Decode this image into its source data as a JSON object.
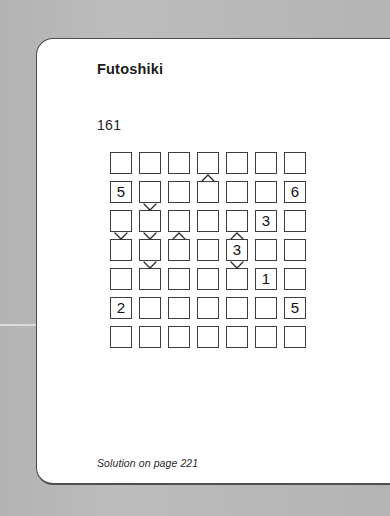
{
  "page": {
    "title": "Futoshiki",
    "puzzle_number": "161",
    "footer": "Solution on page 221",
    "background_color": "#b4b4b4",
    "card_color": "#ffffff",
    "ink_color": "#1b1b1b"
  },
  "puzzle": {
    "type": "futoshiki",
    "size": 7,
    "rows": 7,
    "cols": 7,
    "cells": [
      [
        "",
        "",
        "",
        "",
        "",
        "",
        ""
      ],
      [
        "5",
        "",
        "",
        "",
        "",
        "",
        "6"
      ],
      [
        "",
        "",
        "",
        "",
        "",
        "3",
        ""
      ],
      [
        "",
        "",
        "",
        "",
        "3",
        "",
        ""
      ],
      [
        "",
        "",
        "",
        "",
        "",
        "1",
        ""
      ],
      [
        "2",
        "",
        "",
        "",
        "",
        "",
        "5"
      ],
      [
        "",
        "",
        "",
        "",
        "",
        "",
        ""
      ]
    ],
    "horizontal_constraints": [
      {
        "row": 3,
        "left_col": 2,
        "symbol": "<"
      },
      {
        "row": 4,
        "left_col": 1,
        "symbol": ">"
      },
      {
        "row": 7,
        "left_col": 1,
        "symbol": "<"
      },
      {
        "row": 7,
        "left_col": 2,
        "symbol": "<"
      }
    ],
    "vertical_constraints": [
      {
        "col": 4,
        "top_row": 1,
        "symbol": "^"
      },
      {
        "col": 2,
        "top_row": 2,
        "symbol": "v"
      },
      {
        "col": 1,
        "top_row": 3,
        "symbol": "v"
      },
      {
        "col": 2,
        "top_row": 3,
        "symbol": "v"
      },
      {
        "col": 3,
        "top_row": 3,
        "symbol": "^"
      },
      {
        "col": 5,
        "top_row": 3,
        "symbol": "^"
      },
      {
        "col": 2,
        "top_row": 4,
        "symbol": "v"
      },
      {
        "col": 5,
        "top_row": 4,
        "symbol": "v"
      }
    ]
  }
}
